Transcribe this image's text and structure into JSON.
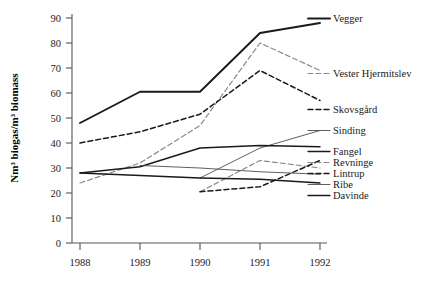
{
  "chart_data": {
    "type": "line",
    "title": "",
    "xlabel": "",
    "ylabel": "Nm³ biogas/m³ biomass",
    "x": [
      1988,
      1989,
      1990,
      1991,
      1992
    ],
    "xticklabels": [
      "1988",
      "1989",
      "1990",
      "1991",
      "1992"
    ],
    "yticklabels": [
      "0",
      "10",
      "20",
      "30",
      "40",
      "50",
      "60",
      "70",
      "80",
      "90"
    ],
    "yticks": [
      0,
      10,
      20,
      30,
      40,
      50,
      60,
      70,
      80,
      90
    ],
    "ylim": [
      0,
      90
    ],
    "xlim": [
      1988,
      1992
    ],
    "grid": false,
    "legend": "right-inline-labels",
    "series": [
      {
        "name": "Vegger",
        "style": "solid-thick",
        "color": "#1a1a1a",
        "values": [
          48,
          60.5,
          60.5,
          84,
          88
        ]
      },
      {
        "name": "Vester Hjermitslev",
        "style": "dashed-gray",
        "color": "#8a8a8a",
        "values": [
          24,
          32,
          47,
          80,
          69
        ]
      },
      {
        "name": "Skovsgård",
        "style": "dashed-dark",
        "color": "#1a1a1a",
        "values": [
          40,
          44.5,
          51.5,
          69,
          57
        ]
      },
      {
        "name": "Sinding",
        "style": "solid-thin",
        "color": "#4d4d4d",
        "values": [
          null,
          null,
          26,
          38,
          45
        ]
      },
      {
        "name": "Fangel",
        "style": "solid-medium",
        "color": "#1a1a1a",
        "values": [
          28,
          30.5,
          38,
          39,
          38.5
        ]
      },
      {
        "name": "Revninge",
        "style": "dashed-gray",
        "color": "#8a8a8a",
        "values": [
          null,
          null,
          20.5,
          33,
          30
        ]
      },
      {
        "name": "Lintrup",
        "style": "dashed-dark",
        "color": "#1a1a1a",
        "values": [
          null,
          null,
          20.5,
          22.5,
          33
        ]
      },
      {
        "name": "Ribe",
        "style": "solid-thin",
        "color": "#4d4d4d",
        "values": [
          null,
          31,
          30,
          28.5,
          27.5
        ]
      },
      {
        "name": "Davinde",
        "style": "solid-medium",
        "color": "#1a1a1a",
        "values": [
          28,
          27,
          26,
          25.5,
          24
        ]
      }
    ],
    "series_labels": [
      {
        "text": "Vegger",
        "y": 22
      },
      {
        "text": "Vester Hjermitslev",
        "y": 77
      },
      {
        "text": "Skovsgård",
        "y": 113
      },
      {
        "text": "Sinding",
        "y": 134
      },
      {
        "text": "Fangel",
        "y": 155
      },
      {
        "text": "Revninge",
        "y": 166
      },
      {
        "text": "Lintrup",
        "y": 177
      },
      {
        "text": "Ribe",
        "y": 188
      },
      {
        "text": "Davinde",
        "y": 199
      }
    ]
  }
}
